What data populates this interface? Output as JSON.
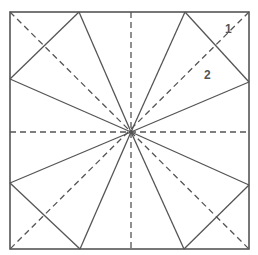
{
  "diagram": {
    "colors": {
      "line": "#555555",
      "background": "#ffffff"
    },
    "square": {
      "x1": 10,
      "y1": 12,
      "x2": 249,
      "y2": 249
    },
    "center": {
      "x": 131,
      "y": 132
    },
    "labels": [
      {
        "text": "1",
        "x": 225,
        "y": 22
      },
      {
        "text": "2",
        "x": 204,
        "y": 68
      }
    ],
    "solid_lines": [
      [
        79,
        12,
        131,
        132
      ],
      [
        185,
        12,
        131,
        132
      ],
      [
        80,
        249,
        131,
        132
      ],
      [
        184,
        249,
        131,
        132
      ],
      [
        10,
        79,
        131,
        132
      ],
      [
        10,
        183,
        131,
        132
      ],
      [
        249,
        82,
        131,
        132
      ],
      [
        249,
        185,
        131,
        132
      ],
      [
        79,
        12,
        10,
        79
      ],
      [
        185,
        12,
        249,
        82
      ],
      [
        10,
        183,
        80,
        249
      ],
      [
        249,
        185,
        184,
        249
      ]
    ],
    "dashed_lines": [
      [
        10,
        12,
        249,
        249
      ],
      [
        249,
        12,
        10,
        249
      ],
      [
        131,
        12,
        131,
        249
      ],
      [
        10,
        132,
        249,
        132
      ]
    ]
  }
}
